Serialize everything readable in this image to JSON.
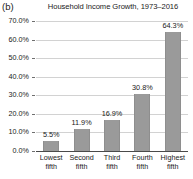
{
  "panel": {
    "label": "(b)"
  },
  "chart_data": {
    "type": "bar",
    "title": "Household Income Growth, 1973–2016",
    "xlabel": "",
    "ylabel": "",
    "ylim": [
      0,
      70
    ],
    "ytick_labels": [
      "70.0%",
      "60.0%",
      "50.0%",
      "40.0%",
      "30.0%",
      "20.0%",
      "10.0%",
      "0.0%"
    ],
    "ytick_values": [
      70,
      60,
      50,
      40,
      30,
      20,
      10,
      0
    ],
    "grid": true,
    "legend": "none",
    "categories": [
      {
        "line1": "Lowest",
        "line2": "fifth"
      },
      {
        "line1": "Second",
        "line2": "fifth"
      },
      {
        "line1": "Third",
        "line2": "fifth"
      },
      {
        "line1": "Fourth",
        "line2": "fifth"
      },
      {
        "line1": "Highest",
        "line2": "fifth"
      }
    ],
    "values": [
      5.5,
      11.9,
      16.9,
      30.8,
      64.3
    ],
    "value_labels": [
      "5.5%",
      "11.9%",
      "16.9%",
      "30.8%",
      "64.3%"
    ],
    "bar_color": "#9a9a9a",
    "gridline_color": "#d2d2d2",
    "axis_color": "#4a4a4a",
    "background": "#ffffff"
  }
}
